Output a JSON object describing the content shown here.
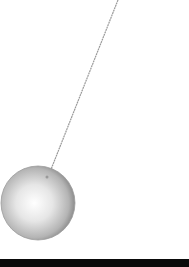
{
  "scene": {
    "subject": "pendulum",
    "string": {
      "x1": 118,
      "y1": 0,
      "x2": 48,
      "y2": 177,
      "color": "#9a9a9a"
    },
    "bob": {
      "cx": 38,
      "cy": 203,
      "r": 37,
      "highlight": "#ffffff",
      "shade": "#8c8c8c"
    },
    "floor": {
      "color": "#0a0a0a"
    },
    "background": "#ffffff"
  }
}
